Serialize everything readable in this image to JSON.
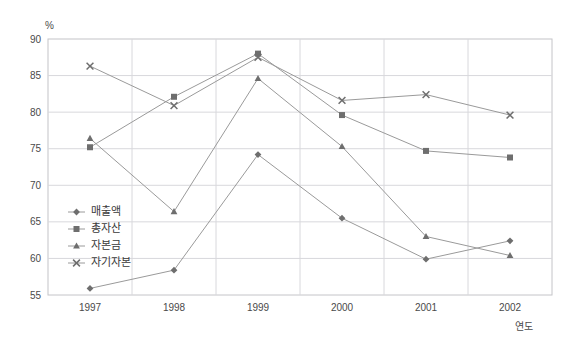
{
  "chart_data": {
    "type": "line",
    "title": "",
    "xlabel": "연도",
    "ylabel": "%",
    "categories": [
      "1997",
      "1998",
      "1999",
      "2000",
      "2001",
      "2002"
    ],
    "ylim": [
      55,
      90
    ],
    "ytick_step": 5,
    "yticks": [
      "55",
      "60",
      "65",
      "70",
      "75",
      "80",
      "85",
      "90"
    ],
    "grid": true,
    "legend_position": "inside-left",
    "series": [
      {
        "name": "매출액",
        "marker": "diamond",
        "color": "#8a8a8a",
        "values": [
          55.9,
          58.4,
          74.2,
          65.5,
          59.9,
          62.4
        ]
      },
      {
        "name": "총자산",
        "marker": "square",
        "color": "#8a8a8a",
        "values": [
          75.2,
          82.1,
          88.0,
          79.6,
          74.7,
          73.8
        ]
      },
      {
        "name": "자본금",
        "marker": "triangle",
        "color": "#8a8a8a",
        "values": [
          76.4,
          66.4,
          84.6,
          75.3,
          63.0,
          60.4
        ]
      },
      {
        "name": "자기자본",
        "marker": "cross",
        "color": "#8a8a8a",
        "values": [
          86.3,
          80.9,
          87.5,
          81.6,
          82.4,
          79.6
        ]
      }
    ]
  },
  "axis": {
    "unit_label": "%",
    "x_axis_title": "연도"
  },
  "colors": {
    "line": "#9a9a9a",
    "marker": "#6e6e6e",
    "grid": "#d8d8dc",
    "border": "#c4c4c8",
    "text": "#4a4a4a"
  }
}
